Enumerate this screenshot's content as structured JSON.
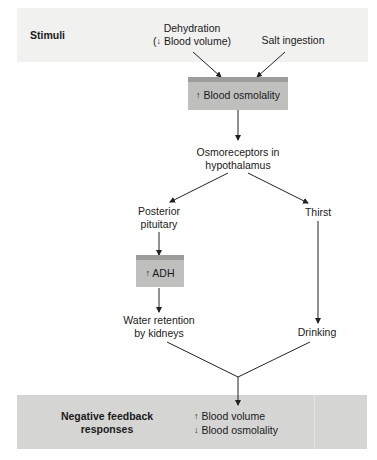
{
  "diagram": {
    "stimuli_band": {
      "title": "Stimuli",
      "items": [
        {
          "line1": "Dehydration",
          "line2_arrow": "↓",
          "line2_text": "Blood volume",
          "line2_open": "(",
          "line2_close": ")"
        },
        {
          "line1": "Salt ingestion"
        }
      ]
    },
    "nodes": {
      "blood_osmolality": {
        "arrow": "↑",
        "text": "Blood osmolality"
      },
      "osmoreceptors": {
        "line1": "Osmoreceptors in",
        "line2": "hypothalamus"
      },
      "posterior_pituitary": {
        "line1": "Posterior",
        "line2": "pituitary"
      },
      "thirst": {
        "text": "Thirst"
      },
      "adh": {
        "arrow": "↑",
        "text": "ADH"
      },
      "water_retention": {
        "line1": "Water retention",
        "line2": "by kidneys"
      },
      "drinking": {
        "text": "Drinking"
      }
    },
    "response_band": {
      "title_line1": "Negative feedback",
      "title_line2": "responses",
      "outcomes": [
        {
          "arrow": "↑",
          "text": "Blood volume"
        },
        {
          "arrow": "↓",
          "text": "Blood osmolality"
        }
      ]
    },
    "colors": {
      "top_band": "#f1f1f0",
      "bottom_band": "#d5d5d4",
      "box_fill": "#bfbfbe",
      "box_bevel": "#9c9c9b",
      "line": "#222222"
    }
  }
}
